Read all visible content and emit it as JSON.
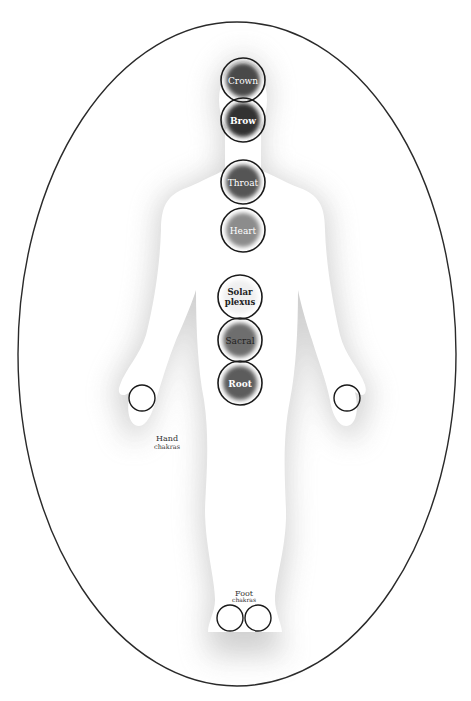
{
  "diagram": {
    "title": "",
    "frame": {
      "shape": "ellipse",
      "cx": 237,
      "cy": 354,
      "rx": 219,
      "ry": 332,
      "stroke": "#333333"
    },
    "colors": {
      "silhouette": "#ffffff",
      "aura": "#d8d8d8",
      "ring": "#1a1a1a"
    },
    "chakras": [
      {
        "id": "crown",
        "label": "Crown",
        "cx": 243,
        "cy": 80,
        "r": 22,
        "fill": "#4a4a4a",
        "text_color": "#e0e0e0"
      },
      {
        "id": "brow",
        "label": "Brow",
        "cx": 243,
        "cy": 120,
        "r": 22,
        "fill": "#3a3a3a",
        "text_color": "#ffffff"
      },
      {
        "id": "throat",
        "label": "Throat",
        "cx": 243,
        "cy": 182,
        "r": 22,
        "fill": "#5a5a5a",
        "text_color": "#ffffff"
      },
      {
        "id": "heart",
        "label": "Heart",
        "cx": 243,
        "cy": 230,
        "r": 22,
        "fill": "#8a8a8a",
        "text_color": "#eeeeee"
      },
      {
        "id": "solar-plexus",
        "label_line1": "Solar",
        "label_line2": "plexus",
        "cx": 240,
        "cy": 297,
        "r": 22,
        "fill": "#f2f2f2",
        "text_color": "#222222"
      },
      {
        "id": "sacral",
        "label": "Sacral",
        "cx": 240,
        "cy": 340,
        "r": 22,
        "fill": "#6a6a6a",
        "text_color": "#111111"
      },
      {
        "id": "root",
        "label": "Root",
        "cx": 240,
        "cy": 383,
        "r": 22,
        "fill": "#5c5c5c",
        "text_color": "#ffffff"
      }
    ],
    "hand_chakras": {
      "label_line1": "Hand",
      "label_line2": "chakras",
      "left": {
        "cx": 142,
        "cy": 398,
        "r": 13
      },
      "right": {
        "cx": 347,
        "cy": 398,
        "r": 13
      }
    },
    "foot_chakras": {
      "label_line1": "Foot",
      "label_line2": "chakras",
      "left": {
        "cx": 230,
        "cy": 618,
        "r": 13
      },
      "right": {
        "cx": 258,
        "cy": 618,
        "r": 13
      }
    }
  }
}
